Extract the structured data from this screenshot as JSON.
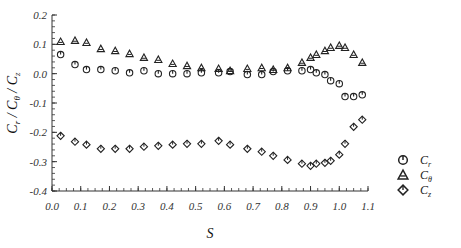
{
  "chart_data": {
    "type": "scatter",
    "title": "",
    "xlabel": "S",
    "ylabel": "C_r / C_θ / C_z",
    "xlim": [
      0.0,
      1.1
    ],
    "ylim": [
      -0.4,
      0.2
    ],
    "grid": false,
    "legend_position": "right",
    "x_ticks": [
      "0.0",
      "0.1",
      "0.2",
      "0.3",
      "0.4",
      "0.5",
      "0.6",
      "0.7",
      "0.8",
      "0.9",
      "1.0",
      "1.1"
    ],
    "y_ticks": [
      "0.2",
      "0.1",
      "0.0",
      "-0.1",
      "-0.2",
      "-0.3",
      "-0.4"
    ],
    "x": [
      0.03,
      0.08,
      0.12,
      0.17,
      0.22,
      0.27,
      0.32,
      0.37,
      0.42,
      0.47,
      0.52,
      0.58,
      0.62,
      0.68,
      0.73,
      0.77,
      0.82,
      0.87,
      0.9,
      0.92,
      0.95,
      0.97,
      1.0,
      1.02,
      1.05,
      1.08
    ],
    "series": [
      {
        "name": "C_r",
        "marker": "circle",
        "values": [
          0.065,
          0.031,
          0.014,
          0.014,
          0.01,
          0.003,
          0.01,
          0.0,
          0.0,
          0.0,
          0.003,
          0.003,
          0.007,
          -0.003,
          -0.003,
          0.007,
          0.01,
          0.01,
          0.014,
          0.003,
          -0.003,
          -0.024,
          -0.034,
          -0.078,
          -0.078,
          -0.072
        ]
      },
      {
        "name": "C_θ",
        "marker": "triangle",
        "values": [
          0.109,
          0.113,
          0.106,
          0.085,
          0.078,
          0.068,
          0.055,
          0.048,
          0.034,
          0.027,
          0.02,
          0.017,
          0.01,
          0.017,
          0.02,
          0.014,
          0.02,
          0.038,
          0.055,
          0.065,
          0.078,
          0.089,
          0.096,
          0.089,
          0.065,
          0.038
        ]
      },
      {
        "name": "C_z",
        "marker": "diamond",
        "values": [
          -0.212,
          -0.232,
          -0.242,
          -0.256,
          -0.256,
          -0.256,
          -0.249,
          -0.246,
          -0.242,
          -0.239,
          -0.239,
          -0.229,
          -0.242,
          -0.256,
          -0.266,
          -0.28,
          -0.294,
          -0.307,
          -0.314,
          -0.307,
          -0.304,
          -0.297,
          -0.276,
          -0.239,
          -0.181,
          -0.157
        ]
      }
    ]
  },
  "legend": [
    {
      "symbol": "circle",
      "main": "C",
      "sub": "r"
    },
    {
      "symbol": "triangle",
      "main": "C",
      "sub": "θ"
    },
    {
      "symbol": "diamond",
      "main": "C",
      "sub": "z"
    }
  ],
  "axes": {
    "xlabel": "S",
    "ylabel_parts": [
      "C",
      "r",
      " / C",
      "θ",
      " / C",
      "z"
    ]
  }
}
